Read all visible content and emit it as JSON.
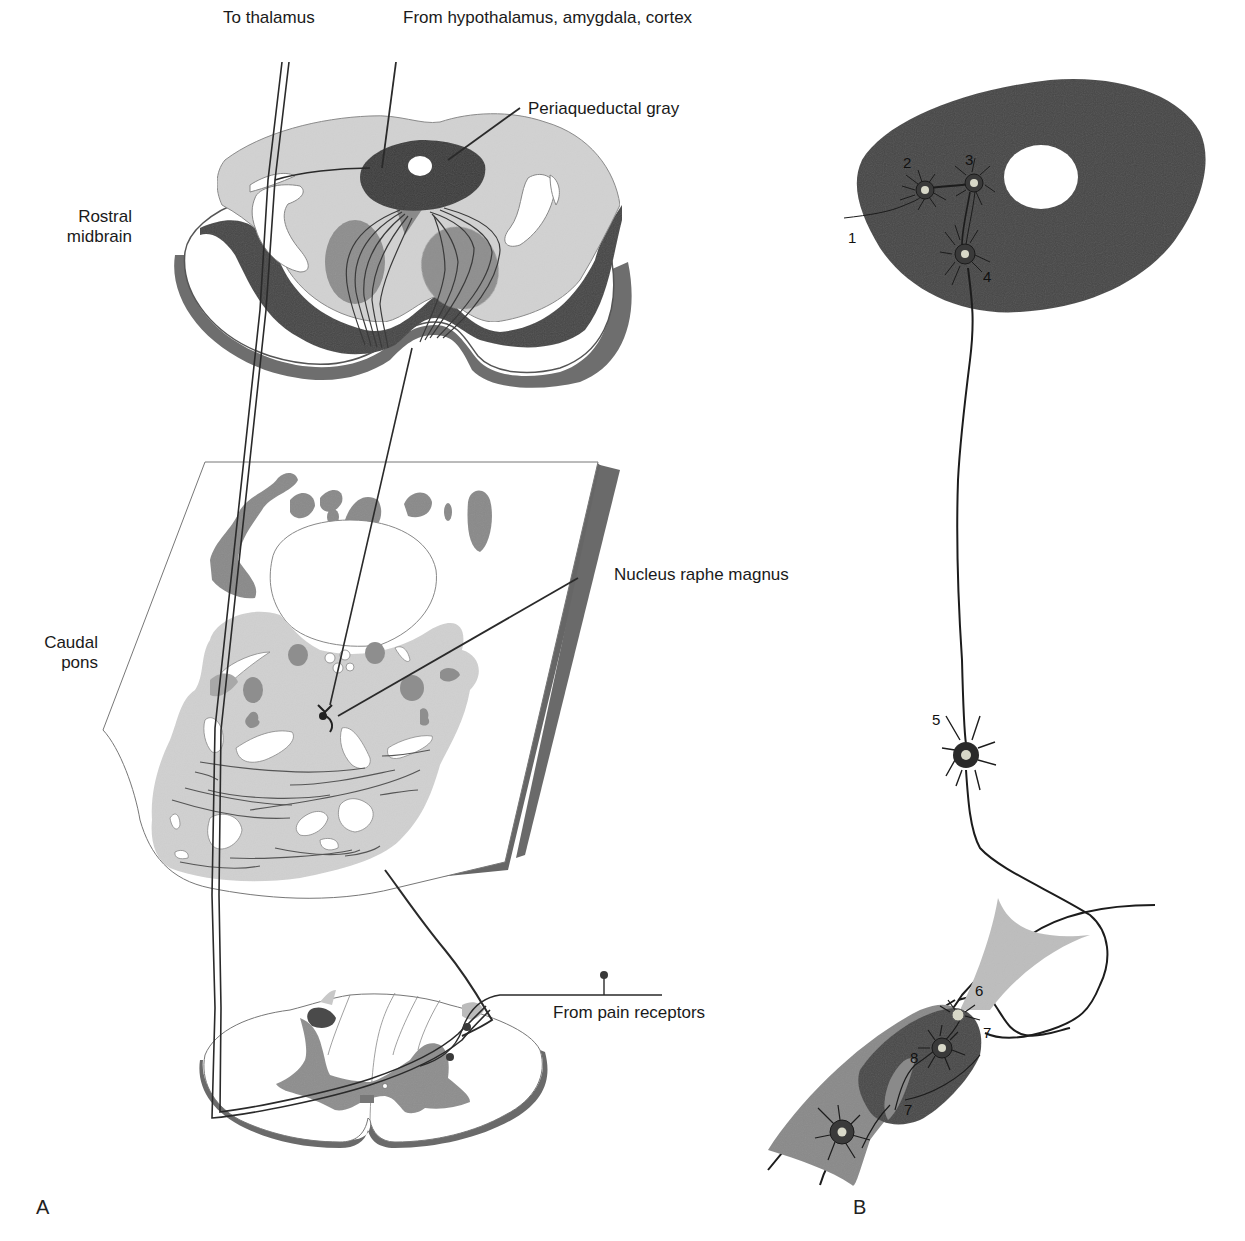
{
  "colors": {
    "background": "#ffffff",
    "light_gray": "#d4d4d4",
    "mid_gray": "#8e8e8e",
    "dark_gray": "#4a4a4a",
    "line": "#333333",
    "soma_highlight": "#d8d8c8"
  },
  "panel_a": {
    "letter": "A",
    "labels": {
      "to_thalamus": "To thalamus",
      "from_hypothalamus": "From hypothalamus, amygdala, cortex",
      "periaqueductal_gray": "Periaqueductal gray",
      "rostral_midbrain": [
        "Rostral",
        "midbrain"
      ],
      "nucleus_raphe_magnus": "Nucleus raphe magnus",
      "caudal_pons": [
        "Caudal",
        "pons"
      ],
      "from_pain_receptors": "From pain receptors"
    },
    "sections": [
      "Rostral midbrain section",
      "Caudal pons section",
      "Spinal cord section"
    ]
  },
  "panel_b": {
    "letter": "B",
    "neuron_labels": [
      "1",
      "2",
      "3",
      "4",
      "5",
      "6",
      "7",
      "8",
      "7"
    ]
  }
}
